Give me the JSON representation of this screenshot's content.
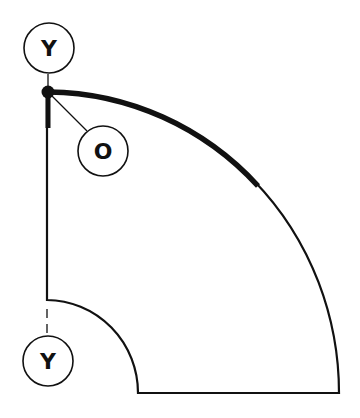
{
  "diagram": {
    "type": "quarter-annulus sector drawing",
    "labels": {
      "top_marker": "Y",
      "origin_marker": "O",
      "bottom_marker": "Y"
    },
    "colors": {
      "stroke": "#111111",
      "background": "#ffffff"
    }
  }
}
